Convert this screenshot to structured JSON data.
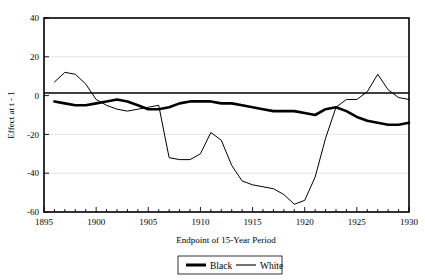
{
  "chart_data": {
    "type": "line",
    "title": "",
    "xlabel": "Endpoint of 15-Year Period",
    "ylabel": "Effect at t - 1",
    "xlim": [
      1895,
      1930
    ],
    "ylim": [
      -60,
      40
    ],
    "xticks": [
      1895,
      1900,
      1905,
      1910,
      1915,
      1920,
      1925,
      1930
    ],
    "xtick_labels": [
      "1895",
      "1900",
      "1905",
      "1910",
      "1915",
      "1920",
      "1925",
      "1930"
    ],
    "minor_xtick_step": 1,
    "yticks": [
      40,
      20,
      0,
      -20,
      -40,
      -60
    ],
    "ytick_labels": [
      "40",
      "20",
      "0",
      "-20",
      "-40",
      "-60"
    ],
    "grid": "horizontal",
    "zero_reference_line": 0,
    "legend_position": "below-center",
    "series": [
      {
        "name": "Black",
        "style": "thick",
        "color": "#000000",
        "x": [
          1896,
          1897,
          1898,
          1899,
          1900,
          1901,
          1902,
          1903,
          1904,
          1905,
          1906,
          1907,
          1908,
          1909,
          1910,
          1911,
          1912,
          1913,
          1914,
          1915,
          1916,
          1917,
          1918,
          1919,
          1920,
          1921,
          1922,
          1923,
          1924,
          1925,
          1926,
          1927,
          1928,
          1929,
          1930
        ],
        "values": [
          -3,
          -4,
          -5,
          -5,
          -4,
          -3,
          -2,
          -3,
          -5,
          -7,
          -7,
          -6,
          -4,
          -3,
          -3,
          -3,
          -4,
          -4,
          -5,
          -6,
          -7,
          -8,
          -8,
          -8,
          -9,
          -10,
          -7,
          -6,
          -8,
          -11,
          -13,
          -14,
          -15,
          -15,
          -14
        ]
      },
      {
        "name": "White",
        "style": "thin",
        "color": "#000000",
        "x": [
          1896,
          1897,
          1898,
          1899,
          1900,
          1901,
          1902,
          1903,
          1904,
          1905,
          1906,
          1907,
          1908,
          1909,
          1910,
          1911,
          1912,
          1913,
          1914,
          1915,
          1916,
          1917,
          1918,
          1919,
          1920,
          1921,
          1922,
          1923,
          1924,
          1925,
          1926,
          1927,
          1928,
          1929,
          1930
        ],
        "values": [
          7,
          12,
          11,
          6,
          -2,
          -5,
          -7,
          -8,
          -7,
          -6,
          -5,
          -32,
          -33,
          -33,
          -30,
          -19,
          -23,
          -36,
          -44,
          -46,
          -47,
          -48,
          -51,
          -56,
          -54,
          -42,
          -22,
          -6,
          -2,
          -2,
          2,
          11,
          3,
          -1,
          -2
        ]
      }
    ],
    "notes": {
      "white_line_deepest": -56,
      "white_line_deepest_year": 1919,
      "white_line_peak": 12,
      "white_line_peak_year": 1897,
      "white_line_late_peak": 11,
      "white_line_late_peak_year": 1927
    }
  },
  "legend": {
    "entries": [
      {
        "label": "Black"
      },
      {
        "label": "White"
      }
    ]
  }
}
